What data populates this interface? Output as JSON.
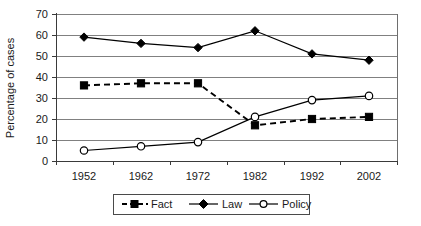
{
  "chart_data": {
    "type": "line",
    "title": "",
    "xlabel": "",
    "ylabel": "Percentage of cases",
    "categories": [
      "1952",
      "1962",
      "1972",
      "1982",
      "1992",
      "2002"
    ],
    "ylim": [
      0,
      70
    ],
    "yticks": [
      "0",
      "10",
      "20",
      "30",
      "40",
      "50",
      "60",
      "70"
    ],
    "grid": true,
    "legend_position": "bottom",
    "series": [
      {
        "name": "Fact",
        "values": [
          36,
          37,
          37,
          17,
          20,
          21
        ],
        "marker": "filled-square",
        "line_style": "dashed",
        "color": "#000000"
      },
      {
        "name": "Law",
        "values": [
          59,
          56,
          54,
          62,
          51,
          48
        ],
        "marker": "filled-diamond",
        "line_style": "solid",
        "color": "#000000"
      },
      {
        "name": "Policy",
        "values": [
          5,
          7,
          9,
          21,
          29,
          31
        ],
        "marker": "open-circle",
        "line_style": "solid",
        "color": "#000000"
      }
    ]
  },
  "axes": {
    "y_title": "Percentage of cases",
    "y_ticks": [
      "70",
      "60",
      "50",
      "40",
      "30",
      "20",
      "10",
      "0"
    ],
    "x_ticks": [
      "1952",
      "1962",
      "1972",
      "1982",
      "1992",
      "2002"
    ]
  },
  "legend": {
    "entries": [
      {
        "label": "Fact"
      },
      {
        "label": "Law"
      },
      {
        "label": "Policy"
      }
    ]
  }
}
